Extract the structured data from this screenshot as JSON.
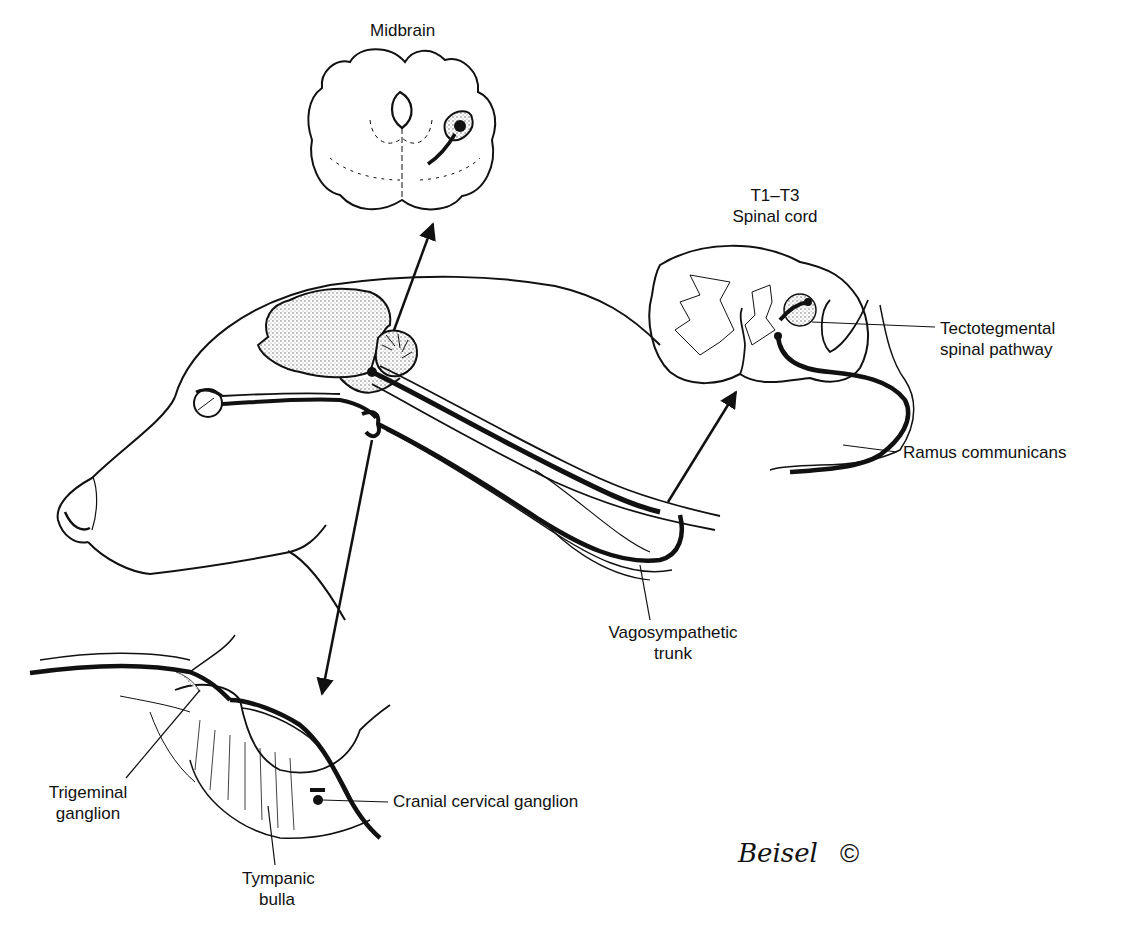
{
  "figure": {
    "labels": {
      "midbrain": "Midbrain",
      "spinal_cord_level": "T1–T3",
      "spinal_cord": "Spinal cord",
      "tectotegmental_line1": "Tectotegmental",
      "tectotegmental_line2": "spinal pathway",
      "ramus": "Ramus communicans",
      "vagosympathetic_line1": "Vagosympathetic",
      "vagosympathetic_line2": "trunk",
      "trigeminal_line1": "Trigeminal",
      "trigeminal_line2": "ganglion",
      "cranial_cervical": "Cranial cervical ganglion",
      "tympanic_line1": "Tympanic",
      "tympanic_line2": "bulla"
    },
    "signature": "Beisel",
    "copyright": "©",
    "colors": {
      "ink": "#111111",
      "stipple": "#bdbdbd",
      "background": "#ffffff"
    }
  }
}
